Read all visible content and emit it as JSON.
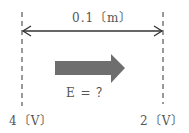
{
  "diagram": {
    "distance_label": "0.1〔m〕",
    "field_label": "E = ？",
    "left_potential": "4〔V〕",
    "right_potential": "2〔V〕",
    "colors": {
      "line": "#333333",
      "dashed": "#555555",
      "field_arrow": "#6e6e6e",
      "text": "#555555"
    }
  }
}
